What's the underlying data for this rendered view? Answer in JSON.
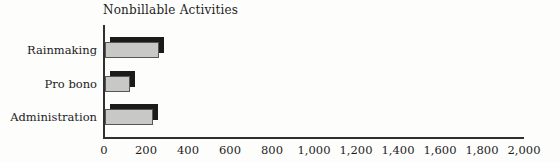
{
  "page": {
    "background": "#fdfdfc"
  },
  "chart_data": {
    "type": "bar",
    "orientation": "horizontal",
    "title": "Nonbillable Activities",
    "categories": [
      "Rainmaking",
      "Pro bono",
      "Administration"
    ],
    "values": [
      260,
      120,
      230
    ],
    "xlabel": "",
    "ylabel": "",
    "xlim": [
      0,
      2000
    ],
    "x_tick_interval": 200,
    "x_tick_labels": [
      "0",
      "200",
      "400",
      "600",
      "800",
      "1,000",
      "1,200",
      "1,400",
      "1,600",
      "1,800",
      "2,000"
    ],
    "grid": false,
    "legend": false,
    "bar_style": "3d-offset-shadow",
    "colors": {
      "bar_fill": "#c8c8c6",
      "bar_border": "#565656",
      "bar_shadow": "#1b1b1b",
      "axis": "#2f2f2f",
      "text": "#1c1c1c",
      "background": "#fdfdfc"
    }
  }
}
